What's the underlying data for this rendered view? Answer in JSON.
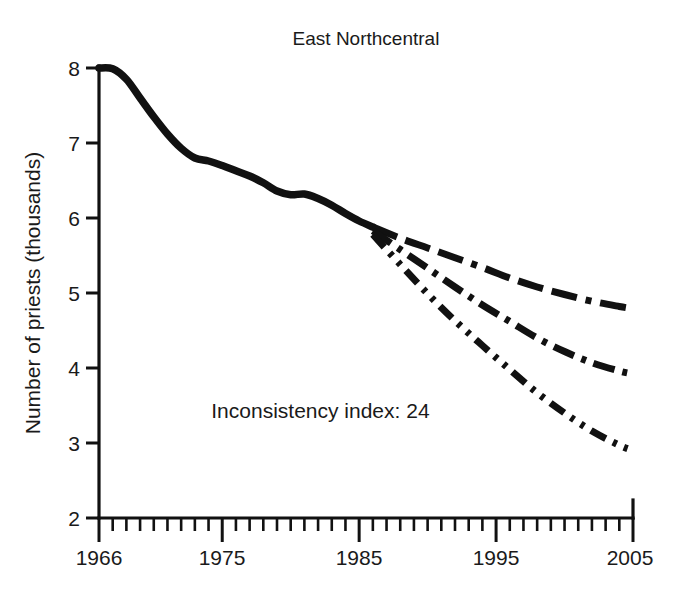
{
  "chart_data": {
    "type": "line",
    "title": "East Northcentral",
    "xlabel": "",
    "ylabel": "Number of priests (thousands)",
    "xlim": [
      1966,
      2005
    ],
    "ylim": [
      2,
      8
    ],
    "xticks": [
      1966,
      1975,
      1985,
      1995,
      2005
    ],
    "xtick_labels": [
      "1966",
      "1975",
      "1985",
      "1995",
      "2005"
    ],
    "yticks": [
      2,
      3,
      4,
      5,
      6,
      7,
      8
    ],
    "ytick_labels": [
      "2",
      "3",
      "4",
      "5",
      "6",
      "7",
      "8"
    ],
    "minor_xtick_interval": 1,
    "grid": false,
    "legend": "none",
    "annotations": [
      {
        "name": "inconsistency-index",
        "text": "Inconsistency index: 24",
        "x": 1974.2,
        "y": 3.33
      }
    ],
    "series": [
      {
        "name": "Historical actual",
        "style": "solid",
        "x": [
          1966,
          1967,
          1968,
          1969,
          1970,
          1971,
          1972,
          1973,
          1974,
          1975,
          1976,
          1977,
          1978,
          1979,
          1980,
          1981,
          1982,
          1983,
          1984,
          1985,
          1986
        ],
        "values": [
          8.0,
          7.99,
          7.85,
          7.6,
          7.35,
          7.12,
          6.93,
          6.8,
          6.76,
          6.7,
          6.63,
          6.56,
          6.47,
          6.36,
          6.31,
          6.32,
          6.26,
          6.17,
          6.06,
          5.96,
          5.88
        ]
      },
      {
        "name": "Projection high",
        "style": "dash-dot",
        "x": [
          1986,
          1988,
          1990,
          1992,
          1994,
          1996,
          1998,
          2000,
          2002,
          2004,
          2005
        ],
        "values": [
          5.88,
          5.73,
          5.6,
          5.47,
          5.34,
          5.2,
          5.08,
          4.98,
          4.89,
          4.82,
          4.79
        ]
      },
      {
        "name": "Projection middle",
        "style": "dash-dot-dot",
        "x": [
          1986,
          1988,
          1990,
          1992,
          1994,
          1996,
          1998,
          2000,
          2002,
          2004,
          2005
        ],
        "values": [
          5.83,
          5.58,
          5.33,
          5.08,
          4.84,
          4.62,
          4.4,
          4.22,
          4.07,
          3.96,
          3.92
        ]
      },
      {
        "name": "Projection low",
        "style": "dash-dot-dot-fine",
        "x": [
          1986,
          1988,
          1990,
          1992,
          1994,
          1996,
          1998,
          2000,
          2002,
          2004,
          2005
        ],
        "values": [
          5.78,
          5.38,
          4.99,
          4.63,
          4.3,
          3.98,
          3.67,
          3.4,
          3.16,
          2.97,
          2.9
        ]
      }
    ]
  },
  "figure": {
    "title": "East Northcentral",
    "y_axis_title": "Number of priests (thousands)",
    "annotation": "Inconsistency index: 24"
  }
}
